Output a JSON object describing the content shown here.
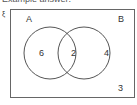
{
  "caption": "Example answer:",
  "diagram": {
    "universal_symbol": "ξ",
    "sets": [
      {
        "name": "A",
        "only_value": "6"
      },
      {
        "name": "B",
        "only_value": "4"
      }
    ],
    "intersection_value": "2",
    "outside_value": "3",
    "line_color": "#555555"
  }
}
